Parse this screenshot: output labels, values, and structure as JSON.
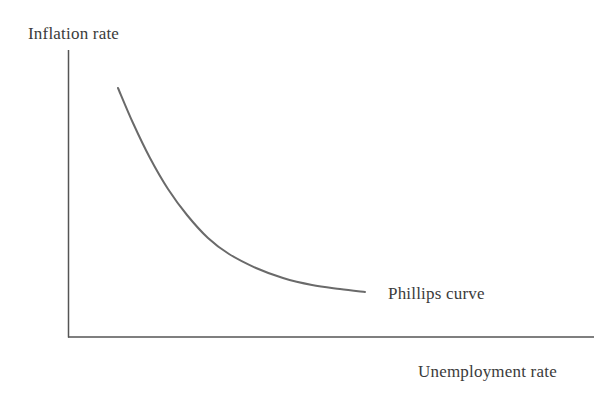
{
  "figure": {
    "background_color": "#ffffff",
    "width": 594,
    "height": 398
  },
  "chart_data": {
    "type": "line",
    "title": "",
    "subtitle": "",
    "xlabel": "Unemployment rate",
    "ylabel": "Inflation rate",
    "grid": false,
    "legend_position": "inline-right-of-curve",
    "axes": {
      "x_axis_visible": true,
      "y_axis_visible": true,
      "x_tick_labels": [],
      "y_tick_labels": [],
      "xlim": [
        0,
        1
      ],
      "ylim": [
        0,
        1
      ],
      "arrowheads": false,
      "axis_color": "#555555",
      "axis_line_width": 1.5,
      "origin_px": [
        68,
        337
      ],
      "x_axis_end_px": [
        594,
        337
      ],
      "y_axis_top_px": [
        68,
        50
      ]
    },
    "series": [
      {
        "name": "Phillips curve",
        "color": "#6a6a6a",
        "line_width": 2,
        "annotation": "Phillips curve",
        "annotation_position_px": [
          388,
          285
        ],
        "description": "Downward-sloping convex curve: high inflation at low unemployment, flattening toward low inflation at high unemployment",
        "x": [
          0.095,
          0.15,
          0.21,
          0.27,
          0.33,
          0.4,
          0.47,
          0.56,
          0.65,
          0.75,
          0.85,
          0.95
        ],
        "y": [
          0.87,
          0.73,
          0.6,
          0.49,
          0.4,
          0.32,
          0.26,
          0.21,
          0.17,
          0.14,
          0.12,
          0.105
        ],
        "points_px": [
          [
            118,
            88
          ],
          [
            133,
            123
          ],
          [
            150,
            158
          ],
          [
            168,
            189
          ],
          [
            187,
            215
          ],
          [
            208,
            238
          ],
          [
            229,
            254
          ],
          [
            256,
            268
          ],
          [
            283,
            278
          ],
          [
            312,
            285
          ],
          [
            340,
            289
          ],
          [
            365,
            292
          ]
        ]
      }
    ],
    "annotations": [
      {
        "text": "Inflation rate",
        "position_px": [
          28,
          25
        ],
        "role": "y-axis-label"
      },
      {
        "text": "Unemployment rate",
        "position_px": [
          418,
          363
        ],
        "role": "x-axis-label"
      },
      {
        "text": "Phillips curve",
        "position_px": [
          388,
          285
        ],
        "role": "series-annotation"
      }
    ]
  },
  "labels": {
    "y_axis": "Inflation rate",
    "x_axis": "Unemployment rate",
    "series": "Phillips curve"
  },
  "colors": {
    "curve": "#6a6a6a",
    "axis": "#555555",
    "text": "#3b3b3b",
    "background": "#ffffff"
  }
}
